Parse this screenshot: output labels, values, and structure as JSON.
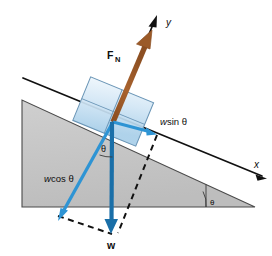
{
  "figure": {
    "name": "inclined-plane-free-body-diagram"
  },
  "colors": {
    "incline_fill": "#c3c3c3",
    "incline_stroke": "#3f3f3f",
    "block_fill_light": "#e4f0fa",
    "block_fill_mid": "#b9d8ee",
    "block_stroke": "#5b89ad",
    "normal_force": "#9b5a28",
    "weight_vector": "#1a6fa8",
    "component_vector": "#2e94d4",
    "axis": "#111111",
    "dashed": "#111111",
    "background": "#ffffff"
  },
  "labels": {
    "axis_y": "y",
    "axis_x": "x",
    "normal_force": "F",
    "normal_force_sub": "N",
    "weight": "w",
    "w_sin_w": "w",
    "w_sin_rest": " sin θ",
    "w_cos_w": "w",
    "w_cos_rest": " cos θ",
    "theta_block": "θ",
    "theta_incline": "θ"
  },
  "geometry": {
    "origin_x": 113,
    "origin_y": 122,
    "incline_angle_deg": 24,
    "vectors": [
      {
        "name": "normal-force",
        "label": "F_N",
        "from": [
          113,
          122
        ],
        "to": [
          152,
          30
        ],
        "color": "#9b5a28"
      },
      {
        "name": "weight",
        "label": "w",
        "from": [
          113,
          122
        ],
        "to": [
          111,
          232
        ],
        "color": "#1a6fa8"
      },
      {
        "name": "w-sin-theta",
        "label": "w sin θ",
        "from": [
          113,
          122
        ],
        "to": [
          156,
          134
        ],
        "color": "#2e94d4"
      },
      {
        "name": "w-cos-theta",
        "label": "w cos θ",
        "from": [
          113,
          122
        ],
        "to": [
          60,
          218
        ],
        "color": "#2e94d4"
      }
    ],
    "axes": [
      {
        "name": "x-axis",
        "from": [
          23,
          78
        ],
        "to": [
          266,
          178
        ]
      },
      {
        "name": "y-axis",
        "from": [
          113,
          122
        ],
        "to": [
          158,
          16
        ]
      }
    ],
    "incline_triangle": [
      [
        22,
        100
      ],
      [
        22,
        207
      ],
      [
        255,
        207
      ]
    ]
  }
}
